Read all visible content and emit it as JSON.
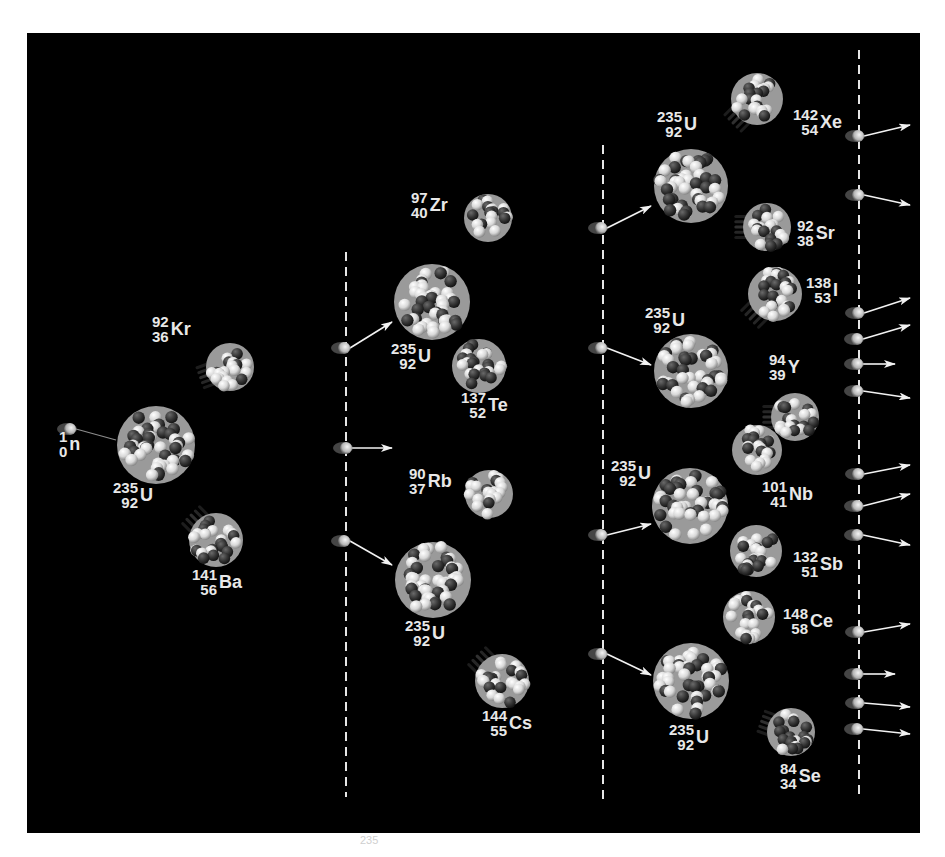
{
  "figure": {
    "background": "#000000",
    "frame": "#ffffff",
    "proton_color": "#e6e6e6",
    "neutron_color": "#3a3a3a",
    "label_color": "#e8e8e8"
  },
  "dashed_lines": [
    {
      "x": 346,
      "y1": 252,
      "y2": 797
    },
    {
      "x": 603,
      "y1": 145,
      "y2": 800
    },
    {
      "x": 859,
      "y1": 50,
      "y2": 797
    }
  ],
  "nuclei": [
    {
      "id": "u235-gen0",
      "kind": "target",
      "cx": 156,
      "cy": 445,
      "r": 39
    },
    {
      "id": "kr92",
      "kind": "fragment",
      "cx": 230,
      "cy": 367,
      "r": 24,
      "trail": "left-down"
    },
    {
      "id": "ba141",
      "kind": "fragment",
      "cx": 216,
      "cy": 540,
      "r": 27,
      "trail": "up-left"
    },
    {
      "id": "zr97",
      "kind": "fragment",
      "cx": 488,
      "cy": 218,
      "r": 24,
      "trail": "none"
    },
    {
      "id": "u235-gen1a",
      "kind": "target",
      "cx": 432,
      "cy": 302,
      "r": 38
    },
    {
      "id": "te137",
      "kind": "fragment",
      "cx": 479,
      "cy": 366,
      "r": 27,
      "trail": "none"
    },
    {
      "id": "rb90",
      "kind": "fragment",
      "cx": 489,
      "cy": 494,
      "r": 24,
      "trail": "none"
    },
    {
      "id": "u235-gen1b",
      "kind": "target",
      "cx": 433,
      "cy": 580,
      "r": 38
    },
    {
      "id": "cs144",
      "kind": "fragment",
      "cx": 502,
      "cy": 681,
      "r": 27,
      "trail": "up-left"
    },
    {
      "id": "xe142",
      "kind": "fragment",
      "cx": 757,
      "cy": 99,
      "r": 26,
      "trail": "down-left"
    },
    {
      "id": "u235-gen2a",
      "kind": "target",
      "cx": 691,
      "cy": 186,
      "r": 37
    },
    {
      "id": "sr92",
      "kind": "fragment",
      "cx": 767,
      "cy": 227,
      "r": 24,
      "trail": "left"
    },
    {
      "id": "i138",
      "kind": "fragment",
      "cx": 775,
      "cy": 294,
      "r": 27,
      "trail": "down-left"
    },
    {
      "id": "u235-gen2b",
      "kind": "target",
      "cx": 691,
      "cy": 371,
      "r": 37
    },
    {
      "id": "y94",
      "kind": "fragment",
      "cx": 795,
      "cy": 417,
      "r": 24,
      "trail": "left"
    },
    {
      "id": "nb101",
      "kind": "fragment",
      "cx": 757,
      "cy": 450,
      "r": 25,
      "trail": "none"
    },
    {
      "id": "u235-gen2c",
      "kind": "target",
      "cx": 690,
      "cy": 506,
      "r": 38
    },
    {
      "id": "sb132",
      "kind": "fragment",
      "cx": 756,
      "cy": 551,
      "r": 26,
      "trail": "none"
    },
    {
      "id": "ce148",
      "kind": "fragment",
      "cx": 749,
      "cy": 617,
      "r": 26,
      "trail": "none"
    },
    {
      "id": "u235-gen2d",
      "kind": "target",
      "cx": 691,
      "cy": 681,
      "r": 38
    },
    {
      "id": "se84",
      "kind": "fragment",
      "cx": 791,
      "cy": 732,
      "r": 24,
      "trail": "left-up"
    }
  ],
  "neutrons": [
    {
      "id": "n-incoming",
      "x": 70,
      "y": 429,
      "ax2": 116,
      "ay2": 440,
      "head": false
    },
    {
      "id": "n-g1-1",
      "x": 344,
      "y": 348,
      "ax2": 392,
      "ay2": 322,
      "head": true
    },
    {
      "id": "n-g1-2",
      "x": 346,
      "y": 448,
      "ax2": 392,
      "ay2": 448,
      "head": true
    },
    {
      "id": "n-g1-3",
      "x": 344,
      "y": 541,
      "ax2": 392,
      "ay2": 565,
      "head": true
    },
    {
      "id": "n-g2-1",
      "x": 601,
      "y": 228,
      "ax2": 651,
      "ay2": 206,
      "head": true
    },
    {
      "id": "n-g2-2",
      "x": 601,
      "y": 348,
      "ax2": 651,
      "ay2": 365,
      "head": true
    },
    {
      "id": "n-g2-3",
      "x": 601,
      "y": 535,
      "ax2": 651,
      "ay2": 524,
      "head": true
    },
    {
      "id": "n-g2-4",
      "x": 601,
      "y": 654,
      "ax2": 651,
      "ay2": 675,
      "head": true
    },
    {
      "id": "n-g3-1",
      "x": 858,
      "y": 136,
      "ax2": 910,
      "ay2": 125,
      "head": true
    },
    {
      "id": "n-g3-2",
      "x": 858,
      "y": 195,
      "ax2": 910,
      "ay2": 205,
      "head": true
    },
    {
      "id": "n-g3-3",
      "x": 858,
      "y": 313,
      "ax2": 910,
      "ay2": 298,
      "head": true
    },
    {
      "id": "n-g3-4",
      "x": 857,
      "y": 339,
      "ax2": 910,
      "ay2": 325,
      "head": true
    },
    {
      "id": "n-g3-5",
      "x": 857,
      "y": 364,
      "ax2": 895,
      "ay2": 364,
      "head": true
    },
    {
      "id": "n-g3-6",
      "x": 857,
      "y": 391,
      "ax2": 910,
      "ay2": 398,
      "head": true
    },
    {
      "id": "n-g3-7",
      "x": 858,
      "y": 474,
      "ax2": 910,
      "ay2": 465,
      "head": true
    },
    {
      "id": "n-g3-8",
      "x": 857,
      "y": 506,
      "ax2": 910,
      "ay2": 494,
      "head": true
    },
    {
      "id": "n-g3-9",
      "x": 857,
      "y": 535,
      "ax2": 910,
      "ay2": 545,
      "head": true
    },
    {
      "id": "n-g3-10",
      "x": 858,
      "y": 632,
      "ax2": 910,
      "ay2": 624,
      "head": true
    },
    {
      "id": "n-g3-11",
      "x": 857,
      "y": 674,
      "ax2": 895,
      "ay2": 674,
      "head": true
    },
    {
      "id": "n-g3-12",
      "x": 858,
      "y": 703,
      "ax2": 910,
      "ay2": 707,
      "head": true
    },
    {
      "id": "n-g3-13",
      "x": 857,
      "y": 729,
      "ax2": 910,
      "ay2": 734,
      "head": true
    }
  ],
  "labels": [
    {
      "id": "label-n",
      "x": 59,
      "y": 444,
      "mass": "1",
      "atomic": "0",
      "symbol": "n"
    },
    {
      "id": "label-u-gen0",
      "x": 113,
      "y": 495,
      "mass": "235",
      "atomic": "92",
      "symbol": "U"
    },
    {
      "id": "label-kr",
      "x": 152,
      "y": 329,
      "mass": "92",
      "atomic": "36",
      "symbol": "Kr"
    },
    {
      "id": "label-ba",
      "x": 192,
      "y": 582,
      "mass": "141",
      "atomic": "56",
      "symbol": "Ba"
    },
    {
      "id": "label-zr",
      "x": 411,
      "y": 205,
      "mass": "97",
      "atomic": "40",
      "symbol": "Zr"
    },
    {
      "id": "label-u-gen1a",
      "x": 391,
      "y": 356,
      "mass": "235",
      "atomic": "92",
      "symbol": "U"
    },
    {
      "id": "label-te",
      "x": 461,
      "y": 405,
      "mass": "137",
      "atomic": "52",
      "symbol": "Te"
    },
    {
      "id": "label-rb",
      "x": 409,
      "y": 481,
      "mass": "90",
      "atomic": "37",
      "symbol": "Rb"
    },
    {
      "id": "label-u-gen1b",
      "x": 405,
      "y": 633,
      "mass": "235",
      "atomic": "92",
      "symbol": "U"
    },
    {
      "id": "label-cs",
      "x": 482,
      "y": 723,
      "mass": "144",
      "atomic": "55",
      "symbol": "Cs"
    },
    {
      "id": "label-xe",
      "x": 793,
      "y": 122,
      "mass": "142",
      "atomic": "54",
      "symbol": "Xe"
    },
    {
      "id": "label-u-gen2a",
      "x": 657,
      "y": 124,
      "mass": "235",
      "atomic": "92",
      "symbol": "U"
    },
    {
      "id": "label-sr",
      "x": 797,
      "y": 233,
      "mass": "92",
      "atomic": "38",
      "symbol": "Sr"
    },
    {
      "id": "label-i",
      "x": 806,
      "y": 290,
      "mass": "138",
      "atomic": "53",
      "symbol": "I"
    },
    {
      "id": "label-u-gen2b",
      "x": 645,
      "y": 320,
      "mass": "235",
      "atomic": "92",
      "symbol": "U"
    },
    {
      "id": "label-y",
      "x": 769,
      "y": 367,
      "mass": "94",
      "atomic": "39",
      "symbol": "Y"
    },
    {
      "id": "label-nb",
      "x": 762,
      "y": 494,
      "mass": "101",
      "atomic": "41",
      "symbol": "Nb"
    },
    {
      "id": "label-u-gen2c",
      "x": 611,
      "y": 473,
      "mass": "235",
      "atomic": "92",
      "symbol": "U"
    },
    {
      "id": "label-sb",
      "x": 793,
      "y": 564,
      "mass": "132",
      "atomic": "51",
      "symbol": "Sb"
    },
    {
      "id": "label-ce",
      "x": 783,
      "y": 621,
      "mass": "148",
      "atomic": "58",
      "symbol": "Ce"
    },
    {
      "id": "label-u-gen2d",
      "x": 669,
      "y": 737,
      "mass": "235",
      "atomic": "92",
      "symbol": "U"
    },
    {
      "id": "label-se",
      "x": 780,
      "y": 776,
      "mass": "84",
      "atomic": "34",
      "symbol": "Se"
    }
  ],
  "footer_stub": "235"
}
